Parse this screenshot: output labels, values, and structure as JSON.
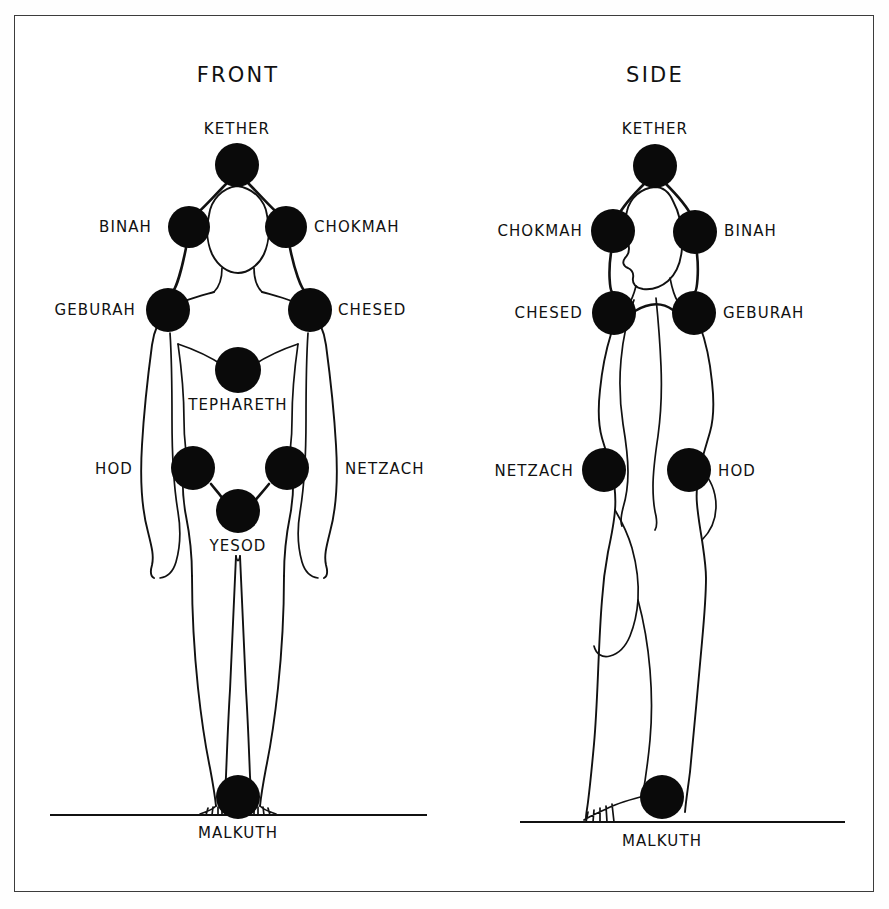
{
  "figure": {
    "frame": {
      "color": "#3c3c3c"
    },
    "ink_color": "#0a0a0a",
    "paper_color": "#ffffff"
  },
  "panels": [
    {
      "id": "front",
      "title": "FRONT",
      "title_x": 238,
      "title_y": 82,
      "ground": {
        "x1": 50,
        "y1": 815,
        "x2": 427,
        "y2": 815
      },
      "malkuth_caption": {
        "text": "MALKUTH",
        "x": 238,
        "y": 838
      },
      "sephiroth": [
        {
          "name": "KETHER",
          "cx": 237,
          "cy": 165,
          "r": 22,
          "label_x": 237,
          "label_y": 134,
          "label_anchor": "middle"
        },
        {
          "name": "BINAH",
          "cx": 189,
          "cy": 227,
          "r": 21,
          "label_x": 152,
          "label_y": 232,
          "label_anchor": "end"
        },
        {
          "name": "CHOKMAH",
          "cx": 286,
          "cy": 227,
          "r": 21,
          "label_x": 314,
          "label_y": 232,
          "label_anchor": "start"
        },
        {
          "name": "GEBURAH",
          "cx": 168,
          "cy": 310,
          "r": 22,
          "label_x": 136,
          "label_y": 315,
          "label_anchor": "end"
        },
        {
          "name": "CHESED",
          "cx": 310,
          "cy": 310,
          "r": 22,
          "label_x": 338,
          "label_y": 315,
          "label_anchor": "start"
        },
        {
          "name": "TEPHARETH",
          "cx": 238,
          "cy": 370,
          "r": 23,
          "label_x": 238,
          "label_y": 410,
          "label_anchor": "middle"
        },
        {
          "name": "HOD",
          "cx": 193,
          "cy": 468,
          "r": 22,
          "label_x": 133,
          "label_y": 474,
          "label_anchor": "end"
        },
        {
          "name": "NETZACH",
          "cx": 287,
          "cy": 468,
          "r": 22,
          "label_x": 345,
          "label_y": 474,
          "label_anchor": "start"
        },
        {
          "name": "YESOD",
          "cx": 238,
          "cy": 511,
          "r": 22,
          "label_x": 238,
          "label_y": 551,
          "label_anchor": "middle"
        },
        {
          "name": "MALKUTH",
          "cx": 238,
          "cy": 797,
          "r": 22,
          "label_x": 238,
          "label_y": 838,
          "label_anchor": "middle"
        }
      ]
    },
    {
      "id": "side",
      "title": "SIDE",
      "title_x": 655,
      "title_y": 82,
      "ground": {
        "x1": 520,
        "y1": 822,
        "x2": 845,
        "y2": 822
      },
      "malkuth_caption": {
        "text": "MALKUTH",
        "x": 662,
        "y": 846
      },
      "sephiroth": [
        {
          "name": "KETHER",
          "cx": 655,
          "cy": 166,
          "r": 22,
          "label_x": 655,
          "label_y": 134,
          "label_anchor": "middle"
        },
        {
          "name": "CHOKMAH",
          "cx": 613,
          "cy": 231,
          "r": 22,
          "label_x": 583,
          "label_y": 236,
          "label_anchor": "end"
        },
        {
          "name": "BINAH",
          "cx": 695,
          "cy": 232,
          "r": 22,
          "label_x": 724,
          "label_y": 236,
          "label_anchor": "start"
        },
        {
          "name": "CHESED",
          "cx": 614,
          "cy": 313,
          "r": 22,
          "label_x": 583,
          "label_y": 318,
          "label_anchor": "end"
        },
        {
          "name": "GEBURAH",
          "cx": 694,
          "cy": 313,
          "r": 22,
          "label_x": 723,
          "label_y": 318,
          "label_anchor": "start"
        },
        {
          "name": "NETZACH",
          "cx": 604,
          "cy": 470,
          "r": 22,
          "label_x": 574,
          "label_y": 476,
          "label_anchor": "end"
        },
        {
          "name": "HOD",
          "cx": 689,
          "cy": 470,
          "r": 22,
          "label_x": 718,
          "label_y": 476,
          "label_anchor": "start"
        },
        {
          "name": "MALKUTH",
          "cx": 662,
          "cy": 797,
          "r": 22,
          "label_x": 662,
          "label_y": 846,
          "label_anchor": "middle"
        }
      ]
    }
  ]
}
